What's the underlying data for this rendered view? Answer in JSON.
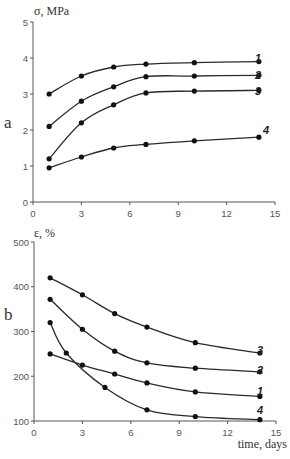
{
  "chart_data": [
    {
      "type": "line",
      "panel_label": "a",
      "title": "",
      "ylabel": "σ, MPa",
      "xlabel": "",
      "xlim": [
        0,
        15
      ],
      "ylim": [
        0,
        5
      ],
      "x_ticks": [
        "0",
        "3",
        "6",
        "9",
        "12",
        "15"
      ],
      "y_ticks": [
        "0",
        "1",
        "2",
        "3",
        "4",
        "5"
      ],
      "grid": false,
      "legend": "inline series numbers at right end",
      "series": [
        {
          "name": "1",
          "x": [
            1,
            3,
            5,
            7,
            10,
            14
          ],
          "values": [
            3.0,
            3.5,
            3.75,
            3.83,
            3.87,
            3.9
          ]
        },
        {
          "name": "2",
          "x": [
            1,
            3,
            5,
            7,
            10,
            14
          ],
          "values": [
            2.1,
            2.8,
            3.2,
            3.48,
            3.5,
            3.52
          ]
        },
        {
          "name": "3",
          "x": [
            1,
            3,
            5,
            7,
            10,
            14
          ],
          "values": [
            1.2,
            2.2,
            2.7,
            3.03,
            3.08,
            3.1
          ]
        },
        {
          "name": "4",
          "x": [
            1,
            3,
            5,
            7,
            10,
            14
          ],
          "values": [
            0.95,
            1.25,
            1.5,
            1.6,
            1.7,
            1.8
          ]
        }
      ]
    },
    {
      "type": "line",
      "panel_label": "b",
      "title": "",
      "ylabel": "ε, %",
      "xlabel": "time, days",
      "xlim": [
        0,
        15
      ],
      "ylim": [
        100,
        500
      ],
      "x_ticks": [
        "0",
        "3",
        "6",
        "9",
        "12",
        "15"
      ],
      "y_ticks": [
        "100",
        "200",
        "300",
        "400",
        "500"
      ],
      "grid": false,
      "legend": "inline series numbers at right end",
      "series": [
        {
          "name": "3",
          "x": [
            1,
            3,
            5,
            7,
            10,
            14
          ],
          "values": [
            420,
            382,
            340,
            310,
            275,
            252
          ]
        },
        {
          "name": "2",
          "x": [
            1,
            3,
            5,
            7,
            10,
            14
          ],
          "values": [
            372,
            305,
            256,
            230,
            218,
            210
          ]
        },
        {
          "name": "1",
          "x": [
            1,
            3,
            5,
            7,
            10,
            14
          ],
          "values": [
            250,
            225,
            205,
            185,
            165,
            155
          ]
        },
        {
          "name": "4",
          "x": [
            1,
            2,
            4.4,
            7,
            10,
            14
          ],
          "values": [
            320,
            252,
            175,
            125,
            110,
            103
          ]
        }
      ]
    }
  ],
  "top": {
    "panel_label": "a",
    "ylabel": "σ, MPa",
    "y_ticks": [
      "0",
      "1",
      "2",
      "3",
      "4",
      "5"
    ],
    "x_ticks": [
      "0",
      "3",
      "6",
      "9",
      "12",
      "15"
    ],
    "series_labels": [
      "1",
      "2",
      "3",
      "4"
    ]
  },
  "bottom": {
    "panel_label": "b",
    "ylabel": "ε, %",
    "xlabel": "time, days",
    "y_ticks": [
      "100",
      "200",
      "300",
      "400",
      "500"
    ],
    "x_ticks": [
      "0",
      "3",
      "6",
      "9",
      "12",
      "15"
    ],
    "series_labels": [
      "3",
      "2",
      "1",
      "4"
    ]
  }
}
